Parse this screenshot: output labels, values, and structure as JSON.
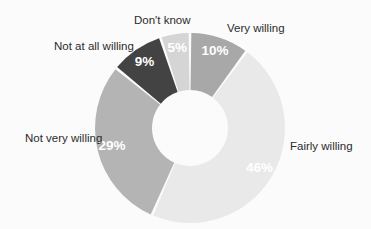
{
  "chart_data": {
    "type": "pie",
    "variant": "donut",
    "title": "",
    "subtitle": "",
    "xlabel": "",
    "ylabel": "",
    "legend_position": "outside-labels",
    "grid": false,
    "unit": "%",
    "total": 99,
    "categories": [
      "Very willing",
      "Fairly willing",
      "Not very willing",
      "Not at all willing",
      "Don't know"
    ],
    "values": [
      10,
      46,
      29,
      9,
      5
    ],
    "value_labels": [
      "10%",
      "46%",
      "29%",
      "9%",
      "5%"
    ],
    "colors": [
      "#a8a8a8",
      "#e9e9e9",
      "#b4b4b4",
      "#434343",
      "#d5d5d5"
    ],
    "slices": [
      {
        "label": "Very willing",
        "value": 10,
        "value_label": "10%",
        "color": "#a8a8a8",
        "label_position": "top-right"
      },
      {
        "label": "Fairly willing",
        "value": 46,
        "value_label": "46%",
        "color": "#e9e9e9",
        "label_position": "right"
      },
      {
        "label": "Not very willing",
        "value": 29,
        "value_label": "29%",
        "color": "#b4b4b4",
        "label_position": "left"
      },
      {
        "label": "Not at all willing",
        "value": 9,
        "value_label": "9%",
        "color": "#434343",
        "label_position": "top-left"
      },
      {
        "label": "Don't know",
        "value": 5,
        "value_label": "5%",
        "color": "#d5d5d5",
        "label_position": "top"
      }
    ]
  },
  "background_color": "#fbfbfb",
  "label_text_color": "#2b2b2b",
  "value_text_color": "#ffffff"
}
